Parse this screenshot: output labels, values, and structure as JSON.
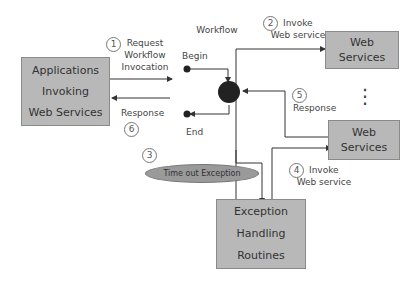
{
  "diagram": {
    "nodes": {
      "apps": {
        "lines": [
          "Applications",
          "Invoking",
          "Web Services"
        ]
      },
      "workflow": {
        "title": "Workflow",
        "begin": "Begin",
        "end": "End"
      },
      "ws1": {
        "lines": [
          "Web",
          "Services"
        ]
      },
      "ws2": {
        "lines": [
          "Web",
          "Services"
        ]
      },
      "exception_routines": {
        "lines": [
          "Exception",
          "Handling",
          "Routines"
        ]
      },
      "timeout": {
        "label": "Time out Exception"
      }
    },
    "steps": [
      {
        "num": "1",
        "lines": [
          "Request",
          "Workflow",
          "Invocation"
        ]
      },
      {
        "num": "2",
        "lines": [
          "Invoke",
          "Web service"
        ]
      },
      {
        "num": "3",
        "lines": []
      },
      {
        "num": "4",
        "lines": [
          "Invoke",
          "Web service"
        ]
      },
      {
        "num": "5",
        "lines": [
          "Response"
        ]
      },
      {
        "num": "6",
        "lines": [
          "Response"
        ]
      }
    ],
    "ellipsis": "⋮",
    "colors": {
      "box_fill": "#b8b8b8",
      "node_fill": "#222222",
      "line": "#333333",
      "ellipse_fill": "#9a9a9a"
    }
  }
}
